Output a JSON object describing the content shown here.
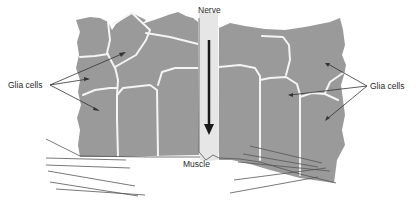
{
  "diagram": {
    "labels": {
      "nerve": "Nerve",
      "glia_left": "Glia cells",
      "glia_right": "Glia cells",
      "muscle": "Muscle"
    },
    "colors": {
      "tissue": "#9a9a9a",
      "cell_boundary": "#f4f4f4",
      "nerve": "#e6e6e6",
      "arrow": "#1a1a1a",
      "text": "#2a2a2a"
    },
    "arrow_direction": "down"
  }
}
